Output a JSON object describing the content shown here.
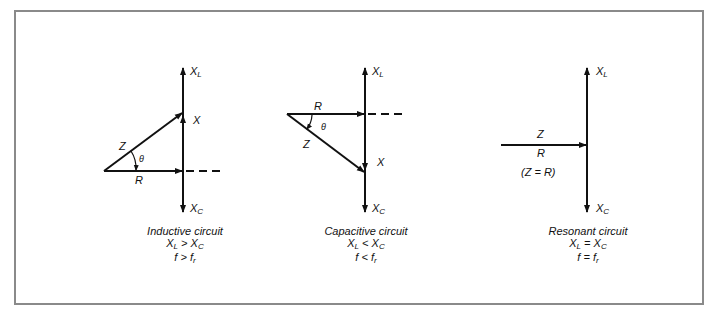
{
  "figure": {
    "panels": [
      {
        "id": "inductive",
        "title": "Inductive circuit",
        "relation_lhs": "X",
        "relation_lhs_sub": "L",
        "relation_op": ">",
        "relation_rhs": "X",
        "relation_rhs_sub": "C",
        "freq_lhs": "f",
        "freq_op": ">",
        "freq_rhs": "f",
        "freq_rhs_sub": "r",
        "labels": {
          "xl": "X",
          "xl_sub": "L",
          "xc": "X",
          "xc_sub": "C",
          "x": "X",
          "z": "Z",
          "r": "R",
          "theta": "θ"
        }
      },
      {
        "id": "capacitive",
        "title": "Capacitive circuit",
        "relation_lhs": "X",
        "relation_lhs_sub": "L",
        "relation_op": "<",
        "relation_rhs": "X",
        "relation_rhs_sub": "C",
        "freq_lhs": "f",
        "freq_op": "<",
        "freq_rhs": "f",
        "freq_rhs_sub": "r",
        "labels": {
          "xl": "X",
          "xl_sub": "L",
          "xc": "X",
          "xc_sub": "C",
          "x": "X",
          "z": "Z",
          "r": "R",
          "theta": "θ"
        }
      },
      {
        "id": "resonant",
        "title": "Resonant circuit",
        "relation_lhs": "X",
        "relation_lhs_sub": "L",
        "relation_op": "=",
        "relation_rhs": "X",
        "relation_rhs_sub": "C",
        "freq_lhs": "f",
        "freq_op": "=",
        "freq_rhs": "f",
        "freq_rhs_sub": "r",
        "labels": {
          "xl": "X",
          "xl_sub": "L",
          "xc": "X",
          "xc_sub": "C",
          "z": "Z",
          "r": "R",
          "equality": "(Z = R)"
        }
      }
    ],
    "colors": {
      "line": "#111111",
      "frame": "#8a8a8a"
    }
  }
}
